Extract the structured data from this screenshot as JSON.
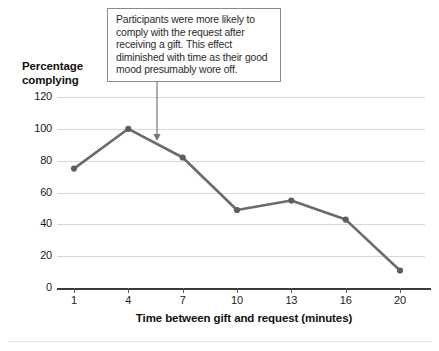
{
  "chart_data": {
    "type": "line",
    "title": "",
    "xlabel": "Time between gift and request (minutes)",
    "ylabel": "Percentage complying",
    "categories": [
      "1",
      "4",
      "7",
      "10",
      "13",
      "16",
      "20"
    ],
    "x": [
      1,
      4,
      7,
      10,
      13,
      16,
      20
    ],
    "values": [
      75,
      100,
      82,
      49,
      55,
      43,
      11
    ],
    "series": [
      {
        "name": "Percentage complying",
        "values": [
          75,
          100,
          82,
          49,
          55,
          43,
          11
        ]
      }
    ],
    "ylim": [
      0,
      120
    ],
    "yticks": [
      0,
      20,
      40,
      60,
      80,
      100,
      120
    ],
    "ytick_labels": [
      "0",
      "20",
      "40",
      "60",
      "80",
      "100",
      "120"
    ],
    "xtick_labels": [
      "1",
      "4",
      "7",
      "10",
      "13",
      "16",
      "20"
    ],
    "grid": true,
    "legend": "none",
    "line_color": "#6b6b6b",
    "marker_color": "#5e5e5e",
    "gridline_color": "#d8d8d8",
    "axis_color": "#3a3a3a",
    "annotations": [
      {
        "text": "Participants were more likely to comply with the request after receiving a gift. This effect diminished with time as their good mood presumably wore off.",
        "points_to_x": 5.6,
        "points_to_y": 91
      }
    ]
  },
  "axis": {
    "y_title_line1": "Percentage",
    "y_title_line2": "complying",
    "x_title": "Time between gift and request (minutes)"
  },
  "annotation": {
    "text": "Participants were more likely to comply with the request after receiving a gift. This effect diminished with time as their good mood presumably wore off."
  }
}
